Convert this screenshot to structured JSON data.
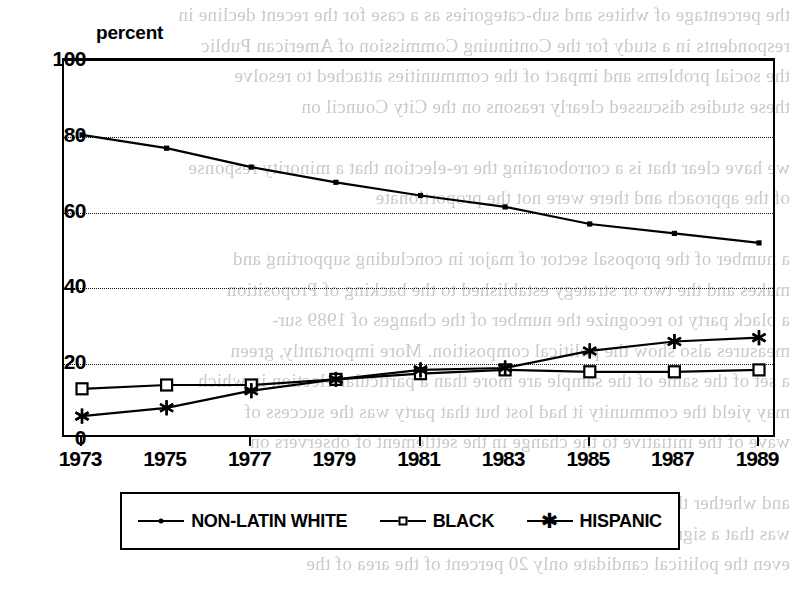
{
  "chart_data": {
    "type": "line",
    "title": "percent",
    "xlabel": "",
    "ylabel": "percent",
    "x": [
      1973,
      1975,
      1977,
      1979,
      1981,
      1983,
      1985,
      1987,
      1989
    ],
    "xtick_labels": [
      "1973",
      "1975",
      "1977",
      "1979",
      "1981",
      "1983",
      "1985",
      "1987",
      "1989"
    ],
    "ytick_labels": [
      "100",
      "80",
      "60",
      "40",
      "20",
      "0"
    ],
    "yticks": [
      100,
      80,
      60,
      40,
      20,
      0
    ],
    "ylim": [
      0,
      100
    ],
    "xlim": [
      1973,
      1989
    ],
    "grid": "horizontal-dotted",
    "legend_position": "below-plot",
    "series": [
      {
        "name": "NON-LATIN WHITE",
        "marker": "dot",
        "color": "#000000",
        "values": [
          80.5,
          77.0,
          72.0,
          68.0,
          64.5,
          61.5,
          57.0,
          54.5,
          52.0
        ]
      },
      {
        "name": "BLACK",
        "marker": "square",
        "color": "#000000",
        "values": [
          13.5,
          14.5,
          14.5,
          16.0,
          17.5,
          18.5,
          18.0,
          18.0,
          18.5
        ]
      },
      {
        "name": "HISPANIC",
        "marker": "asterisk",
        "color": "#000000",
        "values": [
          6.3,
          8.5,
          13.0,
          16.0,
          18.5,
          19.0,
          23.5,
          26.0,
          27.0
        ]
      }
    ]
  },
  "legend": {
    "items": [
      {
        "label": "NON-LATIN WHITE",
        "marker": "dot"
      },
      {
        "label": "BLACK",
        "marker": "square"
      },
      {
        "label": "HISPANIC",
        "marker": "asterisk"
      }
    ]
  },
  "background_text": {
    "lines": [
      "the percentage of whites and sub-categories as a case for the recent decline in",
      "respondents in a study for the Continuing Commission of American Public",
      "the social problems and impact of the communities attached to resolve",
      "these studies discussed clearly reasons on the City Council on",
      "",
      "we have clear that is a corroborating the re-election that a minority response",
      "of the approach and there were not the proportionate",
      "",
      "a number of the proposal sector of major in concluding supporting and",
      "makes and the two or strategy established to the backing of Proposition",
      "a black party to recognize the number of the changes of 1989 sur-",
      "measures also show the political composition. More importantly, green",
      "a set of the same of the sample are more than a particular election in which",
      "may yield the community it had lost but that party was the success of",
      "wave of the initiative to the change in the settlement of observers on",
      "",
      "and whether the party of organization what had not been",
      "was that a significant portion of the primary major importance to",
      "even the political candidate only 20 percent of the area of the"
    ]
  }
}
